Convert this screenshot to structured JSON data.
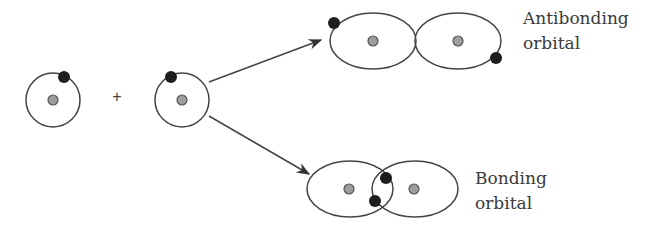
{
  "diagram": {
    "operator": "+",
    "labels": {
      "antibonding_line1": "Antibonding",
      "antibonding_line2": "orbital",
      "bonding_line1": "Bonding",
      "bonding_line2": "orbital"
    },
    "reactants": [
      {
        "name": "atom-1",
        "electrons": 1,
        "nuclei": 1
      },
      {
        "name": "atom-2",
        "electrons": 1,
        "nuclei": 1
      }
    ],
    "products": [
      {
        "name": "antibonding-orbital",
        "lobes": 2,
        "electrons": 2,
        "overlap": false
      },
      {
        "name": "bonding-orbital",
        "lobes": 2,
        "electrons": 2,
        "overlap": true
      }
    ],
    "colors": {
      "electron": "#1e1e1e",
      "nucleus": "#9e9e9e",
      "line": "#444444"
    }
  }
}
